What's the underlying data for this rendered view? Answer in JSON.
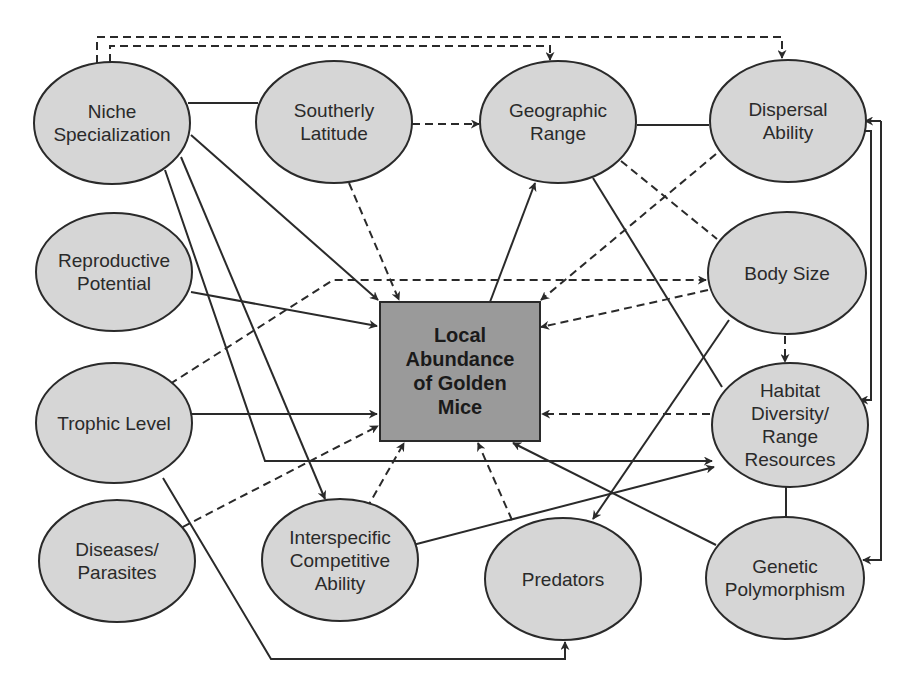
{
  "diagram": {
    "center": {
      "id": "local-abundance",
      "lines": [
        "Local",
        "Abundance",
        "of Golden",
        "Mice"
      ]
    },
    "nodes": [
      {
        "id": "niche-specialization",
        "lines": [
          "Niche",
          "Specialization"
        ]
      },
      {
        "id": "southerly-latitude",
        "lines": [
          "Southerly",
          "Latitude"
        ]
      },
      {
        "id": "geographic-range",
        "lines": [
          "Geographic",
          "Range"
        ]
      },
      {
        "id": "dispersal-ability",
        "lines": [
          "Dispersal",
          "Ability"
        ]
      },
      {
        "id": "reproductive-potential",
        "lines": [
          "Reproductive",
          "Potential"
        ]
      },
      {
        "id": "body-size",
        "lines": [
          "Body Size"
        ]
      },
      {
        "id": "trophic-level",
        "lines": [
          "Trophic Level"
        ]
      },
      {
        "id": "habitat-diversity",
        "lines": [
          "Habitat",
          "Diversity/",
          "Range",
          "Resources"
        ]
      },
      {
        "id": "diseases-parasites",
        "lines": [
          "Diseases/",
          "Parasites"
        ]
      },
      {
        "id": "interspecific-competitive-ability",
        "lines": [
          "Interspecific",
          "Competitive",
          "Ability"
        ]
      },
      {
        "id": "predators",
        "lines": [
          "Predators"
        ]
      },
      {
        "id": "genetic-polymorphism",
        "lines": [
          "Genetic",
          "Polymorphism"
        ]
      }
    ],
    "edges": [
      {
        "from": "niche-specialization",
        "to": "southerly-latitude",
        "style": "solid",
        "arrow": false
      },
      {
        "from": "niche-specialization",
        "to": "geographic-range",
        "style": "dashed",
        "arrow": true
      },
      {
        "from": "niche-specialization",
        "to": "dispersal-ability",
        "style": "dashed",
        "arrow": true
      },
      {
        "from": "niche-specialization",
        "to": "local-abundance",
        "style": "solid",
        "arrow": true
      },
      {
        "from": "niche-specialization",
        "to": "interspecific-competitive-ability",
        "style": "solid",
        "arrow": true
      },
      {
        "from": "niche-specialization",
        "to": "habitat-diversity",
        "style": "solid",
        "arrow": true
      },
      {
        "from": "southerly-latitude",
        "to": "geographic-range",
        "style": "dashed",
        "arrow": true
      },
      {
        "from": "southerly-latitude",
        "to": "local-abundance",
        "style": "dashed",
        "arrow": true
      },
      {
        "from": "geographic-range",
        "to": "dispersal-ability",
        "style": "solid",
        "arrow": false
      },
      {
        "from": "geographic-range",
        "to": "body-size",
        "style": "dashed",
        "arrow": false
      },
      {
        "from": "geographic-range",
        "to": "habitat-diversity",
        "style": "solid",
        "arrow": false
      },
      {
        "from": "local-abundance",
        "to": "geographic-range",
        "style": "solid",
        "arrow": true
      },
      {
        "from": "dispersal-ability",
        "to": "local-abundance",
        "style": "dashed",
        "arrow": true
      },
      {
        "from": "dispersal-ability",
        "to": "habitat-diversity",
        "style": "solid",
        "arrow": true
      },
      {
        "from": "dispersal-ability",
        "to": "genetic-polymorphism",
        "style": "solid",
        "arrow": true
      },
      {
        "from": "reproductive-potential",
        "to": "local-abundance",
        "style": "solid",
        "arrow": true
      },
      {
        "from": "trophic-level",
        "to": "body-size",
        "style": "dashed",
        "arrow": true
      },
      {
        "from": "trophic-level",
        "to": "local-abundance",
        "style": "solid",
        "arrow": true
      },
      {
        "from": "trophic-level",
        "to": "predators",
        "style": "solid",
        "arrow": true
      },
      {
        "from": "body-size",
        "to": "local-abundance",
        "style": "dashed",
        "arrow": true
      },
      {
        "from": "body-size",
        "to": "habitat-diversity",
        "style": "dashed",
        "arrow": true
      },
      {
        "from": "body-size",
        "to": "predators",
        "style": "solid",
        "arrow": true
      },
      {
        "from": "habitat-diversity",
        "to": "local-abundance",
        "style": "dashed",
        "arrow": true
      },
      {
        "from": "habitat-diversity",
        "to": "interspecific-competitive-ability",
        "style": "solid",
        "arrow": "both"
      },
      {
        "from": "habitat-diversity",
        "to": "genetic-polymorphism",
        "style": "solid",
        "arrow": false
      },
      {
        "from": "diseases-parasites",
        "to": "local-abundance",
        "style": "dashed",
        "arrow": true
      },
      {
        "from": "interspecific-competitive-ability",
        "to": "local-abundance",
        "style": "dashed",
        "arrow": true
      },
      {
        "from": "predators",
        "to": "local-abundance",
        "style": "dashed",
        "arrow": true
      },
      {
        "from": "genetic-polymorphism",
        "to": "local-abundance",
        "style": "solid",
        "arrow": true
      }
    ],
    "colors": {
      "node_fill": "#d6d6d6",
      "center_fill": "#9a9a9a",
      "stroke": "#2a2a2a",
      "background": "#ffffff"
    }
  }
}
